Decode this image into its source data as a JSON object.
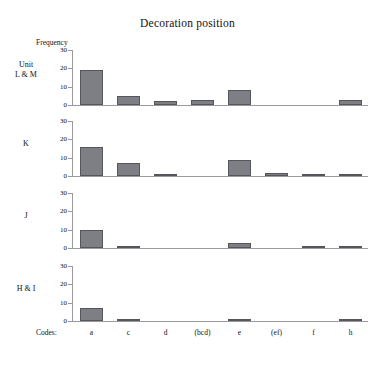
{
  "chart_data": {
    "type": "bar",
    "title": "Decoration position",
    "xlabel": "Codes:",
    "ylabel": "Frequency",
    "ylim": [
      0,
      30
    ],
    "yticks": [
      0,
      10,
      20,
      30
    ],
    "grid": false,
    "legend": "none",
    "layout": "4 stacked panels sharing one x axis",
    "categories": [
      "a",
      "c",
      "d",
      "(bcd)",
      "e",
      "(ef)",
      "f",
      "h"
    ],
    "series": [
      {
        "name": "Unit L & M",
        "values": [
          19,
          5,
          2,
          3,
          8,
          0,
          0,
          3
        ]
      },
      {
        "name": "K",
        "values": [
          16,
          7,
          1,
          0,
          9,
          1.5,
          0.8,
          0.8
        ]
      },
      {
        "name": "J",
        "values": [
          10,
          1,
          0,
          0,
          2.5,
          0,
          0.7,
          0.7
        ]
      },
      {
        "name": "H & I",
        "values": [
          7,
          1,
          0,
          0,
          0.7,
          0,
          0,
          0.7
        ]
      }
    ]
  },
  "panels": [
    {
      "label_line1": "Unit",
      "label_line2": "L & M"
    },
    {
      "label_line1": "K",
      "label_line2": ""
    },
    {
      "label_line1": "J",
      "label_line2": ""
    },
    {
      "label_line1": "H & I",
      "label_line2": ""
    }
  ],
  "colors": {
    "bar_fill": "#7e7e85",
    "bar_edge": "#55555c",
    "axis": "#999a9e",
    "text": "#111111",
    "background": "#ffffff"
  }
}
